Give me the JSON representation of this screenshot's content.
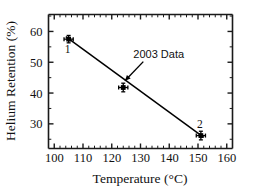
{
  "chart_data": {
    "type": "scatter",
    "title": "",
    "xlabel": "Temperature (°C)",
    "ylabel": "Helium Retention (%)",
    "xlim": [
      98,
      162
    ],
    "ylim": [
      22.0,
      65.5
    ],
    "xticks": [
      100,
      110,
      120,
      130,
      140,
      150,
      160
    ],
    "xtick_labels": [
      "100",
      "110",
      "120",
      "130",
      "140",
      "150",
      "160"
    ],
    "yticks": [
      30,
      40,
      50,
      60
    ],
    "ytick_labels": [
      "30",
      "40",
      "50",
      "60"
    ],
    "x_minor_step": 2,
    "y_minor_step": 5,
    "grid": false,
    "legend": null,
    "series": [
      {
        "name": "2003 Data",
        "marker": "cross",
        "x": [
          105,
          124,
          151
        ],
        "y": [
          57.5,
          41.8,
          26.2
        ],
        "x_err": [
          1.6,
          1.6,
          1.6
        ],
        "y_err": [
          1.2,
          1.4,
          1.4
        ],
        "point_labels": [
          "1",
          "",
          "2"
        ]
      },
      {
        "name": "linear fit",
        "type": "line",
        "x": [
          104.0,
          152.0
        ],
        "y": [
          58.3,
          25.6
        ]
      }
    ],
    "annotations": [
      {
        "text": "2003 Data",
        "text_x": 127.5,
        "text_y": 51.5,
        "arrow_to_x": 124.6,
        "arrow_to_y": 44.0
      }
    ]
  },
  "axes": {
    "x_title": "Temperature (°C)",
    "y_title": "Helium Retention (%)"
  },
  "point_markers": {
    "label_1": "1",
    "label_2": "2"
  },
  "colors": {
    "line": "#000000",
    "marker": "#000000",
    "axis": "#1a1a1a",
    "text": "#111111",
    "background": "#ffffff"
  }
}
